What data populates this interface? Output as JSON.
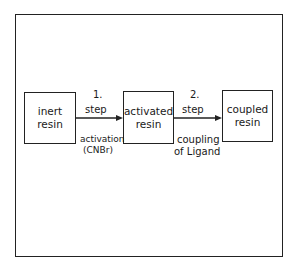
{
  "diagram": {
    "nodes": [
      {
        "id": "inert",
        "line1": "inert",
        "line2": "resin"
      },
      {
        "id": "activated",
        "line1": "activated",
        "line2": "resin"
      },
      {
        "id": "coupled",
        "line1": "coupled",
        "line2": "resin"
      }
    ],
    "edges": [
      {
        "from": "inert",
        "to": "activated",
        "number": "1.",
        "step": "step",
        "desc1": "activation",
        "desc2": "(CNBr)"
      },
      {
        "from": "activated",
        "to": "coupled",
        "number": "2.",
        "step": "step",
        "desc1": "coupling",
        "desc2": "of Ligand"
      }
    ]
  }
}
